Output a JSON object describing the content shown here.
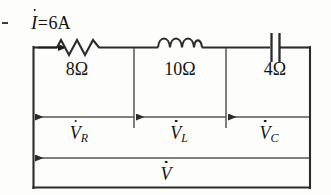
{
  "figure": {
    "type": "electrical-circuit-schematic"
  },
  "source": {
    "label": "I",
    "dot_notation": true,
    "equals": "=",
    "value": "6",
    "unit": "A",
    "full_text": "I = 6A",
    "arrow_direction": "right"
  },
  "components": [
    {
      "id": "resistor",
      "kind": "resistor",
      "symbol": "zigzag",
      "value": "8",
      "unit": "Ω",
      "label": "8Ω"
    },
    {
      "id": "inductor",
      "kind": "inductor",
      "symbol": "coil",
      "value": "10",
      "unit": "Ω",
      "label": "10Ω"
    },
    {
      "id": "capacitor",
      "kind": "capacitor",
      "symbol": "parallel-plates",
      "value": "4",
      "unit": "Ω",
      "label": "4Ω"
    }
  ],
  "voltages": [
    {
      "id": "vr",
      "base": "V",
      "subscript": "R",
      "dot_notation": true,
      "label": "V_R",
      "arrow_direction": "left"
    },
    {
      "id": "vl",
      "base": "V",
      "subscript": "L",
      "dot_notation": true,
      "label": "V_L",
      "arrow_direction": "left"
    },
    {
      "id": "vc",
      "base": "V",
      "subscript": "C",
      "dot_notation": true,
      "label": "V_C",
      "arrow_direction": "left"
    },
    {
      "id": "vtotal",
      "base": "V",
      "subscript": "",
      "dot_notation": true,
      "label": "V",
      "arrow_direction": "left"
    }
  ],
  "colors": {
    "line": "#2b2b2b",
    "thin_line": "#555555",
    "text": "#141414",
    "background": "#fdfdfb"
  }
}
